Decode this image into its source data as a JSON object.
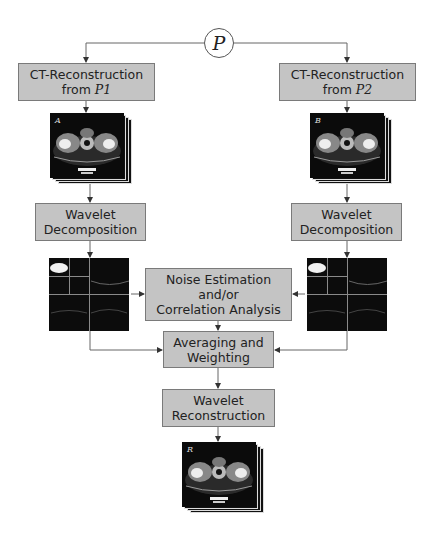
{
  "diagram": {
    "source_node": {
      "label": "P"
    },
    "left_branch": {
      "reconstruction": {
        "line1": "CT-Reconstruction",
        "line2_prefix": "from ",
        "line2_var": "P1"
      },
      "ct_image": {
        "label": "A"
      },
      "decomposition": {
        "line1": "Wavelet",
        "line2": "Decomposition"
      }
    },
    "right_branch": {
      "reconstruction": {
        "line1": "CT-Reconstruction",
        "line2_prefix": "from ",
        "line2_var": "P2"
      },
      "ct_image": {
        "label": "B"
      },
      "decomposition": {
        "line1": "Wavelet",
        "line2": "Decomposition"
      }
    },
    "noise_box": {
      "line1": "Noise Estimation",
      "line2": "and/or",
      "line3": "Correlation Analysis"
    },
    "averaging_box": {
      "line1": "Averaging and",
      "line2": "Weighting"
    },
    "reconstruction_box": {
      "line1": "Wavelet",
      "line2": "Reconstruction"
    },
    "output_image": {
      "label": "R"
    },
    "colors": {
      "box_fill": "#c4c4c4",
      "box_border": "#7a7a7a",
      "line": "#555555"
    }
  }
}
